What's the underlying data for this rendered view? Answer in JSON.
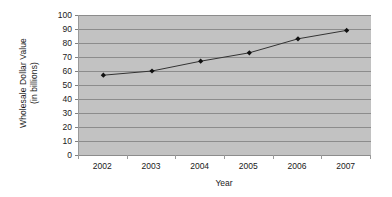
{
  "chart_data": {
    "type": "line",
    "title": "",
    "xlabel": "Year",
    "ylabel": "Wholesale Dollar Value (in billions)",
    "ylabel_lines": [
      "Wholesale Dollar Value",
      "(in billions)"
    ],
    "categories": [
      "2002",
      "2003",
      "2004",
      "2005",
      "2006",
      "2007"
    ],
    "values": [
      57,
      60,
      67,
      73,
      83,
      89
    ],
    "series": [
      {
        "name": "Wholesale Dollar Value",
        "values": [
          57,
          60,
          67,
          73,
          83,
          89
        ]
      }
    ],
    "ylim": [
      0,
      100
    ],
    "ytick_values": [
      0,
      10,
      20,
      30,
      40,
      50,
      60,
      70,
      80,
      90,
      100
    ],
    "ytick_labels": [
      "0",
      "10",
      "20",
      "30",
      "40",
      "50",
      "60",
      "70",
      "80",
      "90",
      "100"
    ],
    "grid": "horizontal",
    "legend": "none",
    "marker": "filled-diamond",
    "line_color": "#333333",
    "marker_color": "#111111",
    "plot_background": "#c2c2c2",
    "gridline_color": "#8c8c8c",
    "axis_color": "#8c8c8c",
    "text_color": "#1a1a1a",
    "chart_background": "#ffffff"
  }
}
